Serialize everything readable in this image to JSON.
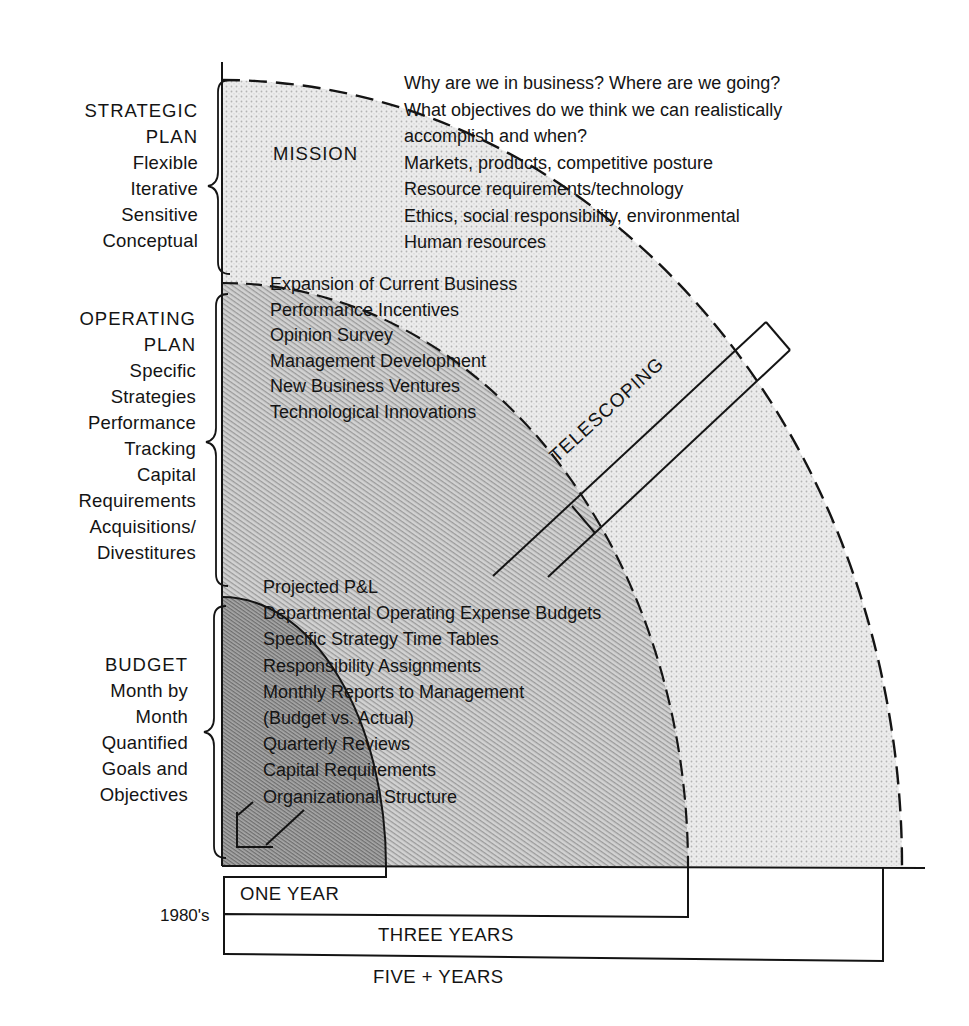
{
  "diagram": {
    "type": "concentric planning horizon diagram",
    "colors": {
      "ink": "#141414",
      "outer_fill": "#e2e2e2",
      "middle_fill": "#c6c6c6",
      "inner_fill": "#9c9c9c",
      "background": "#ffffff"
    }
  },
  "strategic_plan": {
    "heading_line1": "STRATEGIC",
    "heading_line2": "PLAN",
    "traits": [
      "Flexible",
      "Iterative",
      "Sensitive",
      "Conceptual"
    ],
    "zone_label": "MISSION",
    "items": [
      "Why are we in business?  Where are we going?",
      "What objectives do we think we can realistically",
      "accomplish and when?",
      "Markets, products, competitive posture",
      "Resource requirements/technology",
      "Ethics, social responsibility, environmental",
      "Human resources"
    ]
  },
  "operating_plan": {
    "heading_line1": "OPERATING",
    "heading_line2": "PLAN",
    "traits": [
      "Specific",
      "Strategies",
      "Performance",
      "Tracking",
      "Capital",
      "Requirements",
      "Acquisitions/",
      "Divestitures"
    ],
    "items": [
      "Expansion of Current Business",
      "Performance Incentives",
      "Opinion Survey",
      "Management Development",
      "New Business Ventures",
      "Technological Innovations"
    ]
  },
  "budget": {
    "heading": "BUDGET",
    "traits": [
      "Month by",
      "Month",
      "Quantified",
      "Goals and",
      "Objectives"
    ],
    "items": [
      "Projected P&L",
      "Departmental Operating Expense Budgets",
      "Specific Strategy Time Tables",
      "Responsibility Assignments",
      "Monthly Reports to Management",
      "(Budget vs. Actual)",
      "Quarterly Reviews",
      "Capital Requirements",
      "Organizational Structure"
    ]
  },
  "telescoping": {
    "label": "TELESCOPING"
  },
  "timeline": {
    "decade": "1980's",
    "one_year": "ONE YEAR",
    "three_years": "THREE YEARS",
    "five_plus_years": "FIVE + YEARS"
  }
}
